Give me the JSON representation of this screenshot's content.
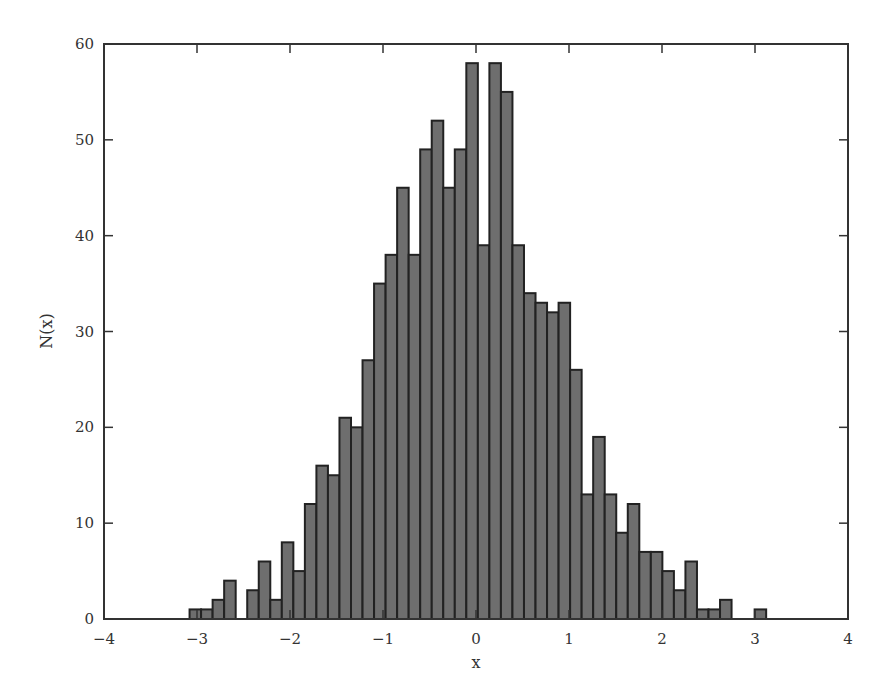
{
  "chart_data": {
    "type": "bar",
    "subtype": "histogram",
    "title": "",
    "xlabel": "x",
    "ylabel": "N(x)",
    "xlim": [
      -4,
      4
    ],
    "ylim": [
      0,
      60
    ],
    "xticks": [
      -4,
      -3,
      -2,
      -1,
      0,
      1,
      2,
      3,
      4
    ],
    "xtick_labels": [
      "−4",
      "−3",
      "−2",
      "−1",
      "0",
      "1",
      "2",
      "3",
      "4"
    ],
    "yticks": [
      0,
      10,
      20,
      30,
      40,
      50,
      60
    ],
    "ytick_labels": [
      "0",
      "10",
      "20",
      "30",
      "40",
      "50",
      "60"
    ],
    "grid": false,
    "legend": null,
    "bin_start": -3.08,
    "bin_width": 0.124,
    "values": [
      1,
      1,
      2,
      4,
      0,
      3,
      6,
      2,
      8,
      5,
      12,
      16,
      15,
      21,
      20,
      27,
      35,
      38,
      45,
      38,
      49,
      52,
      45,
      49,
      58,
      39,
      58,
      55,
      39,
      34,
      33,
      32,
      33,
      26,
      13,
      19,
      13,
      9,
      12,
      7,
      7,
      5,
      3,
      6,
      1,
      1,
      2,
      0,
      0,
      1
    ],
    "bar_color": "#6e6e6e",
    "edge_color": "#222222"
  }
}
